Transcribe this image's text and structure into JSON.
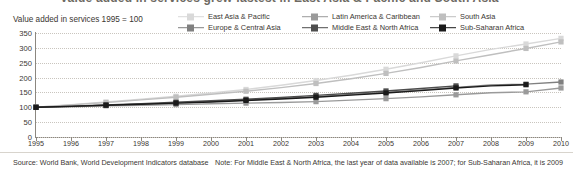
{
  "title_fragment": "Value added in services grew fastest in East Asia & Pacific and South Asia",
  "subtitle": "Value added in services 1995 = 100",
  "legend": [
    {
      "label": "East Asia & Pacific",
      "color": "#d9d9d9",
      "row": 0,
      "col": 0
    },
    {
      "label": "Latin America & Caribbean",
      "color": "#9a9a9a",
      "row": 0,
      "col": 1
    },
    {
      "label": "South Asia",
      "color": "#bfbfbf",
      "row": 0,
      "col": 2
    },
    {
      "label": "Europe & Central Asia",
      "color": "#808080",
      "row": 1,
      "col": 0
    },
    {
      "label": "Middle East & North Africa",
      "color": "#4d4d4d",
      "row": 1,
      "col": 1
    },
    {
      "label": "Sub-Saharan Africa",
      "color": "#1a1a1a",
      "row": 1,
      "col": 2
    }
  ],
  "footer": {
    "source": "Source:  World Bank, World Development Indicators database",
    "note": "Note: For Middle East & North Africa, the last year of data available is 2007; for Sub-Saharan Africa, it is 2009"
  },
  "chart_data": {
    "type": "line",
    "title": "Value added in services grew fastest in East Asia & Pacific and South Asia",
    "subtitle": "Value added in services 1995 = 100",
    "xlabel": "",
    "ylabel": "",
    "index_base": "1995 = 100",
    "grid": true,
    "legend_position": "top",
    "x": [
      1995,
      1996,
      1997,
      1998,
      1999,
      2000,
      2001,
      2002,
      2003,
      2004,
      2005,
      2006,
      2007,
      2008,
      2009,
      2010
    ],
    "xlim": [
      1995,
      2010
    ],
    "ylim": [
      0,
      350
    ],
    "yticks": [
      0,
      50,
      100,
      150,
      200,
      250,
      300,
      350
    ],
    "xticks": [
      "1995",
      "1996",
      "1997",
      "1998",
      "1999",
      "2000",
      "2001",
      "2002",
      "2003",
      "2004",
      "2005",
      "2006",
      "2007",
      "2008",
      "2009",
      "2010"
    ],
    "series": [
      {
        "name": "East Asia & Pacific",
        "color": "#d9d9d9",
        "values": [
          100,
          109,
          118,
          127,
          137,
          148,
          160,
          174,
          190,
          208,
          228,
          250,
          273,
          295,
          313,
          332
        ]
      },
      {
        "name": "South Asia",
        "color": "#bfbfbf",
        "values": [
          100,
          108,
          116,
          125,
          134,
          144,
          154,
          166,
          180,
          196,
          214,
          234,
          256,
          277,
          298,
          320
        ]
      },
      {
        "name": "Europe & Central Asia",
        "color": "#808080",
        "values": [
          100,
          103,
          107,
          110,
          114,
          119,
          124,
          130,
          136,
          143,
          150,
          158,
          167,
          175,
          178,
          185
        ]
      },
      {
        "name": "Latin America & Caribbean",
        "color": "#9a9a9a",
        "values": [
          100,
          102,
          105,
          107,
          109,
          112,
          114,
          116,
          119,
          124,
          129,
          135,
          142,
          149,
          152,
          165
        ]
      },
      {
        "name": "Middle East & North Africa",
        "color": "#4d4d4d",
        "values": [
          100,
          104,
          108,
          112,
          117,
          122,
          127,
          133,
          140,
          147,
          155,
          163,
          172,
          null,
          null,
          null
        ],
        "last_year": 2007
      },
      {
        "name": "Sub-Saharan Africa",
        "color": "#1a1a1a",
        "values": [
          100,
          103,
          107,
          110,
          114,
          118,
          123,
          128,
          134,
          141,
          148,
          156,
          165,
          172,
          176,
          null
        ],
        "last_year": 2009
      }
    ]
  }
}
